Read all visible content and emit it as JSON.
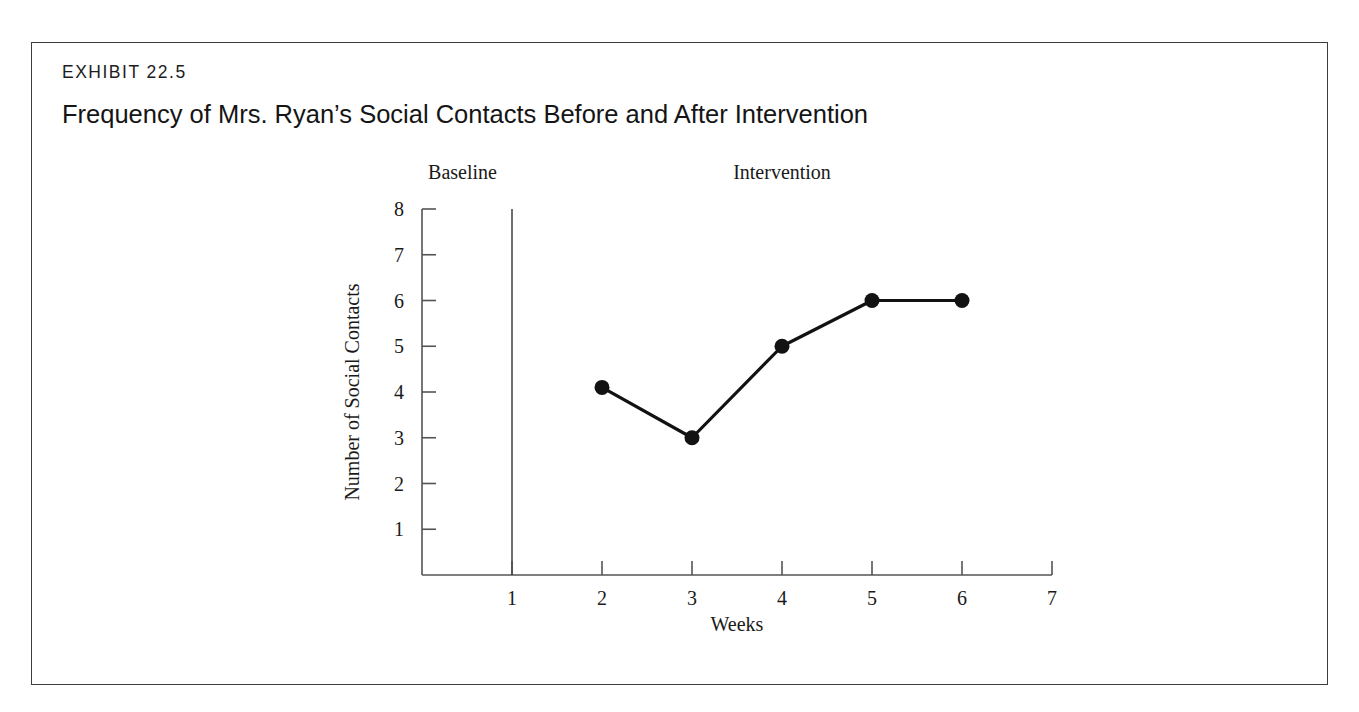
{
  "page": {
    "top_sliver_text": "",
    "background_color": "#ffffff",
    "border_color": "#3d3d3d"
  },
  "exhibit": {
    "label": "EXHIBIT 22.5",
    "title": "Frequency of Mrs. Ryan’s Social Contacts Before and After Intervention"
  },
  "chart_data": {
    "type": "line",
    "title": "Frequency of Mrs. Ryan’s Social Contacts Before and After Intervention",
    "xlabel": "Weeks",
    "ylabel": "Number of Social Contacts",
    "xlim": [
      0,
      7
    ],
    "ylim": [
      0,
      8
    ],
    "xticks": [
      "1",
      "2",
      "3",
      "4",
      "5",
      "6",
      "7"
    ],
    "xtick_values": [
      1,
      2,
      3,
      4,
      5,
      6,
      7
    ],
    "yticks": [
      "1",
      "2",
      "3",
      "4",
      "5",
      "6",
      "7",
      "8"
    ],
    "ytick_values": [
      1,
      2,
      3,
      4,
      5,
      6,
      7,
      8
    ],
    "grid": false,
    "legend": false,
    "x": [
      2,
      3,
      4,
      5,
      6
    ],
    "values": [
      4.1,
      3.0,
      5.0,
      6.0,
      6.0
    ],
    "series": [
      {
        "name": "Social contacts",
        "x": [
          2,
          3,
          4,
          5,
          6
        ],
        "values": [
          4.1,
          3.0,
          5.0,
          6.0,
          6.0
        ],
        "marker": "filled-circle",
        "color": "#121212"
      }
    ],
    "phase_change_line": {
      "x": 1,
      "color": "#4a4a4a"
    },
    "annotations": [
      {
        "text": "Baseline",
        "x": 0.45,
        "position": "above-plot"
      },
      {
        "text": "Intervention",
        "x": 4.0,
        "position": "above-plot"
      }
    ],
    "phase_labels": {
      "baseline": "Baseline",
      "intervention": "Intervention"
    }
  }
}
